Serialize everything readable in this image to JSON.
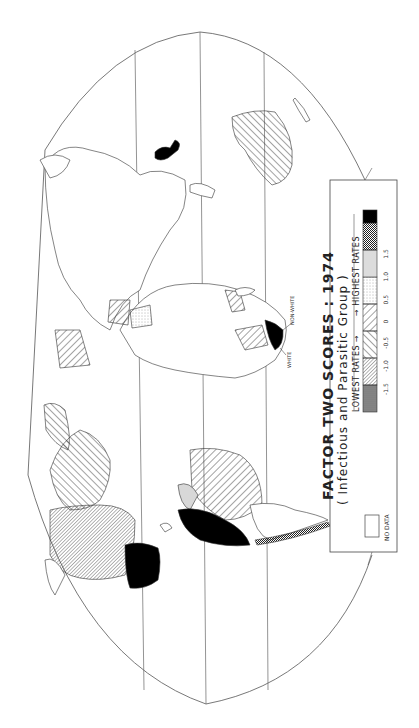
{
  "map": {
    "title": "FACTOR TWO SCORES : 1974",
    "subtitle": "( Infectious and Parasitic Group )",
    "orientation": "rotated 90 degrees clockwise",
    "projection": "world map, elliptical/interrupted outline",
    "annotations": {
      "white": "WHITE",
      "non_white": "NON-WHITE"
    }
  },
  "legend": {
    "lowest_label": "LOWEST RATES",
    "highest_label": "HIGHEST RATES",
    "arrow_left": "←",
    "arrow_right": "→",
    "classes": [
      {
        "range": "< -1.5",
        "pattern": "dark-gray-dots",
        "color": "#8a8a8a"
      },
      {
        "range": "-1.5 to -1.0",
        "pattern": "fine-diagonal-dense",
        "color": "#bdbdbd"
      },
      {
        "range": "-1.0 to -0.5",
        "pattern": "diagonal-back",
        "color": "#d0d0d0"
      },
      {
        "range": "-0.5 to 0",
        "pattern": "diagonal-forward-wide",
        "color": "#e5e5e5"
      },
      {
        "range": "0 to 0.5",
        "pattern": "light-stipple",
        "color": "#f0f0f0"
      },
      {
        "range": "0.5 to 1.0",
        "pattern": "light-gray",
        "color": "#dcdcdc"
      },
      {
        "range": "1.0 to 1.5",
        "pattern": "cross-hatch-dots",
        "color": "#a8a8a8"
      },
      {
        "range": "> 1.5",
        "pattern": "solid-black",
        "color": "#000000"
      }
    ],
    "ticks": [
      "-1.5",
      "-1.0",
      "-0.5",
      "0",
      "0.5",
      "1.0",
      "1.5"
    ],
    "no_data_label": "NO DATA"
  }
}
